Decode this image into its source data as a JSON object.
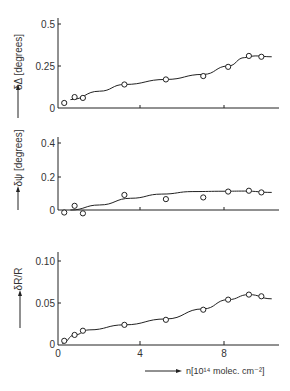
{
  "chart_data": [
    {
      "type": "scatter",
      "title": "",
      "ylabel": "δΔ [degrees]",
      "xlabel": "",
      "ylim": [
        0,
        0.55
      ],
      "xlim": [
        0,
        11
      ],
      "yticks": [
        "0",
        "0.25",
        "0.5"
      ],
      "grid": false,
      "points": [
        {
          "x": 0.3,
          "y": 0.03
        },
        {
          "x": 0.8,
          "y": 0.065
        },
        {
          "x": 1.2,
          "y": 0.06
        },
        {
          "x": 3.2,
          "y": 0.14
        },
        {
          "x": 5.2,
          "y": 0.17
        },
        {
          "x": 7.0,
          "y": 0.19
        },
        {
          "x": 8.2,
          "y": 0.245
        },
        {
          "x": 9.2,
          "y": 0.31
        },
        {
          "x": 9.8,
          "y": 0.305
        }
      ],
      "fit_curve": [
        [
          0.6,
          0.05
        ],
        [
          2,
          0.1
        ],
        [
          3.2,
          0.14
        ],
        [
          5.2,
          0.17
        ],
        [
          7,
          0.2
        ],
        [
          8.2,
          0.25
        ],
        [
          9,
          0.3
        ],
        [
          9.5,
          0.31
        ],
        [
          10.3,
          0.305
        ]
      ]
    },
    {
      "type": "scatter",
      "title": "",
      "ylabel": "δψ [degrees]",
      "xlabel": "",
      "ylim": [
        0,
        0.45
      ],
      "xlim": [
        0,
        11
      ],
      "yticks": [
        "0",
        "0.2",
        "0.4"
      ],
      "grid": false,
      "points": [
        {
          "x": 0.3,
          "y": -0.015
        },
        {
          "x": 0.8,
          "y": 0.025
        },
        {
          "x": 1.2,
          "y": -0.02
        },
        {
          "x": 3.2,
          "y": 0.09
        },
        {
          "x": 5.2,
          "y": 0.065
        },
        {
          "x": 7.0,
          "y": 0.075
        },
        {
          "x": 8.2,
          "y": 0.11
        },
        {
          "x": 9.2,
          "y": 0.115
        },
        {
          "x": 9.8,
          "y": 0.105
        }
      ],
      "fit_curve": [
        [
          0.6,
          0
        ],
        [
          2,
          0.03
        ],
        [
          3.5,
          0.07
        ],
        [
          5,
          0.095
        ],
        [
          6.5,
          0.11
        ],
        [
          8,
          0.112
        ],
        [
          9,
          0.113
        ],
        [
          10.3,
          0.105
        ]
      ]
    },
    {
      "type": "scatter",
      "title": "",
      "ylabel": "δR/R",
      "xlabel": "n[10¹⁴ molec. cm⁻²]",
      "ylim": [
        0,
        0.115
      ],
      "xlim": [
        0,
        11
      ],
      "yticks": [
        "0",
        "0.05",
        "0.10"
      ],
      "xticks": [
        "0",
        "4",
        "8"
      ],
      "grid": false,
      "points": [
        {
          "x": 0.3,
          "y": 0.005
        },
        {
          "x": 0.8,
          "y": 0.012
        },
        {
          "x": 1.2,
          "y": 0.017
        },
        {
          "x": 3.2,
          "y": 0.024
        },
        {
          "x": 5.2,
          "y": 0.03
        },
        {
          "x": 7.0,
          "y": 0.042
        },
        {
          "x": 8.2,
          "y": 0.054
        },
        {
          "x": 9.2,
          "y": 0.06
        },
        {
          "x": 9.8,
          "y": 0.058
        }
      ],
      "fit_curve": [
        [
          0.2,
          0.002
        ],
        [
          0.8,
          0.012
        ],
        [
          1.5,
          0.018
        ],
        [
          3.2,
          0.024
        ],
        [
          5.2,
          0.031
        ],
        [
          7,
          0.043
        ],
        [
          8.2,
          0.054
        ],
        [
          9.2,
          0.06
        ],
        [
          10.3,
          0.055
        ]
      ]
    }
  ],
  "panels": {
    "top": {
      "ylabel": "δΔ [degrees]",
      "ticks": [
        "0.5",
        "0.25",
        "0"
      ]
    },
    "middle": {
      "ylabel": "δψ [degrees]",
      "ticks": [
        "0.4",
        "0.2",
        "0"
      ]
    },
    "bottom": {
      "ylabel": "δR/R",
      "ticks": [
        "0.10",
        "0.05",
        "0"
      ]
    },
    "xaxis": {
      "ticks": [
        "0",
        "4",
        "8"
      ],
      "label": "n[10¹⁴ molec. cm⁻²]"
    }
  }
}
